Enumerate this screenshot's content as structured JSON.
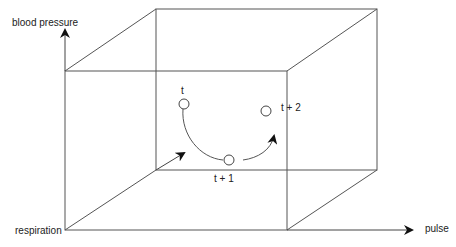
{
  "diagram": {
    "type": "3d-state-space-cube",
    "axes": {
      "vertical": "blood pressure",
      "depth": "respiration",
      "horizontal": "pulse"
    },
    "states": [
      {
        "label": "t"
      },
      {
        "label": "t + 1"
      },
      {
        "label": "t + 2"
      }
    ],
    "colors": {
      "line": "#444444",
      "text": "#222222",
      "background": "#ffffff"
    }
  }
}
